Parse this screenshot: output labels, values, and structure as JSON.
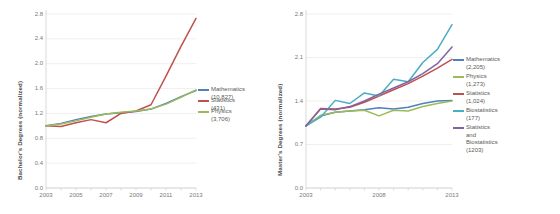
{
  "chart_data": [
    {
      "id": "bachelors",
      "type": "line",
      "title": "",
      "xlabel": "",
      "ylabel": "Bachelor's Degrees (normalized)",
      "x": [
        2003,
        2004,
        2005,
        2006,
        2007,
        2008,
        2009,
        2010,
        2011,
        2012,
        2013
      ],
      "xticks": [
        "2003",
        "2005",
        "2007",
        "2009",
        "2011",
        "2013"
      ],
      "xtick_values": [
        2003,
        2005,
        2007,
        2009,
        2011,
        2013
      ],
      "yticks": [
        "0.0",
        "0.4",
        "0.8",
        "1.2",
        "1.6",
        "2.0",
        "2.4",
        "2.8"
      ],
      "ytick_values": [
        0.0,
        0.4,
        0.8,
        1.2,
        1.6,
        2.0,
        2.4,
        2.8
      ],
      "xlim": [
        2003,
        2013
      ],
      "ylim": [
        0.0,
        2.8
      ],
      "grid": "horizontal",
      "legend_position": "right",
      "series": [
        {
          "name": "Mathematics (10,827)",
          "color": "#4f81bd",
          "values": [
            1.0,
            1.04,
            1.1,
            1.15,
            1.19,
            1.21,
            1.23,
            1.27,
            1.36,
            1.47,
            1.57
          ]
        },
        {
          "name": "Statistics (431)",
          "color": "#c0504d",
          "values": [
            1.0,
            0.99,
            1.05,
            1.1,
            1.05,
            1.2,
            1.24,
            1.34,
            1.8,
            2.28,
            2.73
          ]
        },
        {
          "name": "Physics (3,706)",
          "color": "#9bbb59",
          "values": [
            1.0,
            1.03,
            1.08,
            1.14,
            1.19,
            1.22,
            1.24,
            1.27,
            1.35,
            1.46,
            1.58
          ]
        }
      ]
    },
    {
      "id": "masters",
      "type": "line",
      "title": "",
      "xlabel": "",
      "ylabel": "Master's Degrees (normalized)",
      "x": [
        2003,
        2004,
        2005,
        2006,
        2007,
        2008,
        2009,
        2010,
        2011,
        2012,
        2013
      ],
      "xticks": [
        "2003",
        "2008",
        "2013"
      ],
      "xtick_values": [
        2003,
        2008,
        2013
      ],
      "yticks": [
        "0.0",
        "0.7",
        "1.4",
        "2.1",
        "2.8"
      ],
      "ytick_values": [
        0.0,
        0.7,
        1.4,
        2.1,
        2.8
      ],
      "xlim": [
        2003,
        2013
      ],
      "ylim": [
        0.0,
        2.8
      ],
      "grid": "horizontal",
      "legend_position": "right",
      "series": [
        {
          "name": "Mathematics (2,205)",
          "color": "#4f81bd",
          "values": [
            1.0,
            1.16,
            1.22,
            1.24,
            1.26,
            1.29,
            1.27,
            1.3,
            1.36,
            1.4,
            1.41
          ]
        },
        {
          "name": "Physics (1,273)",
          "color": "#9bbb59",
          "values": [
            1.0,
            1.17,
            1.22,
            1.24,
            1.25,
            1.16,
            1.25,
            1.24,
            1.31,
            1.36,
            1.4
          ]
        },
        {
          "name": "Statistics (1,024)",
          "color": "#c0504d",
          "values": [
            1.0,
            1.28,
            1.27,
            1.3,
            1.38,
            1.48,
            1.58,
            1.68,
            1.8,
            1.93,
            2.07
          ]
        },
        {
          "name": "Biostatistics (177)",
          "color": "#4bacc6",
          "values": [
            1.0,
            1.14,
            1.41,
            1.36,
            1.53,
            1.48,
            1.75,
            1.71,
            2.02,
            2.23,
            2.63
          ]
        },
        {
          "name": "Statistics and Biostatistics (1203)",
          "color": "#8064a2",
          "values": [
            1.0,
            1.27,
            1.26,
            1.31,
            1.4,
            1.51,
            1.61,
            1.71,
            1.84,
            2.0,
            2.27
          ]
        }
      ]
    }
  ],
  "panels": {
    "left": {
      "ylabel": "Bachelor's Degrees (normalized)",
      "yticks": [
        "2.8",
        "2.4",
        "2.0",
        "1.6",
        "1.2",
        "0.8",
        "0.4",
        "0.0"
      ],
      "xticks": [
        "2003",
        "2005",
        "2007",
        "2009",
        "2011",
        "2013"
      ],
      "legend": [
        {
          "label": "Mathematics (10,827)",
          "color": "#4f81bd"
        },
        {
          "label": "Statistics (431)",
          "color": "#c0504d"
        },
        {
          "label": "Physics (3,706)",
          "color": "#9bbb59"
        }
      ]
    },
    "right": {
      "ylabel": "Master's Degrees (normalized)",
      "yticks": [
        "2.8",
        "2.1",
        "1.4",
        "0.7",
        "0.0"
      ],
      "xticks": [
        "2003",
        "2008",
        "2013"
      ],
      "legend": [
        {
          "label": "Mathematics (2,205)",
          "color": "#4f81bd"
        },
        {
          "label": "Physics (1,273)",
          "color": "#9bbb59"
        },
        {
          "label": "Statistics (1,024)",
          "color": "#c0504d"
        },
        {
          "label": "Biostatistics (177)",
          "color": "#4bacc6"
        },
        {
          "label": "Statistics and Biostatistics\n(1203)",
          "color": "#8064a2"
        }
      ]
    }
  }
}
